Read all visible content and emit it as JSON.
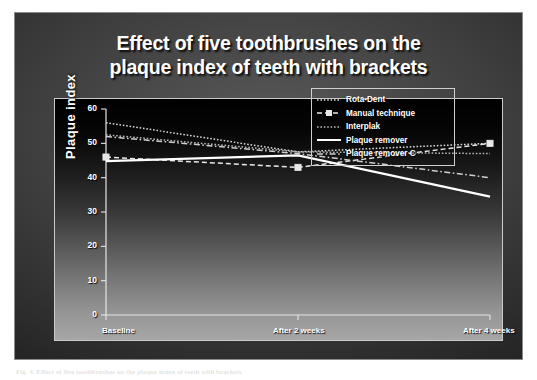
{
  "slide": {
    "title": "Effect of five toothbrushes on the\nplaque index of teeth with brackets",
    "background_color": "#3f3f3f",
    "border_color": "#8b8b8b"
  },
  "caption": {
    "text": "Fig. 4. Effect of five toothbrushes on the plaque index of teeth with brackets"
  },
  "chart_data": {
    "type": "line",
    "title": "Effect of five toothbrushes on the plaque index of teeth with brackets",
    "xlabel": "",
    "ylabel": "Plaque index",
    "categories": [
      "Baseline",
      "After 2 weeks",
      "After 4 weeks"
    ],
    "ylim": [
      0,
      60
    ],
    "yticks": [
      0,
      10,
      20,
      30,
      40,
      50,
      60
    ],
    "grid": false,
    "legend_position": "right",
    "series": [
      {
        "name": "Rota-Dent",
        "values": [
          56,
          47.5,
          50
        ],
        "color": "#d8d8d8",
        "line_style": "dotted",
        "marker": "none"
      },
      {
        "name": "Manual technique",
        "values": [
          46,
          43,
          50
        ],
        "color": "#e8e8e8",
        "line_style": "dashed",
        "marker": "square"
      },
      {
        "name": "Interplak",
        "values": [
          52.5,
          47.5,
          47
        ],
        "color": "#b8b8b8",
        "line_style": "dotted",
        "marker": "none"
      },
      {
        "name": "Plaque remover",
        "values": [
          44.8,
          46.5,
          34.5
        ],
        "color": "#ffffff",
        "line_style": "solid",
        "marker": "none"
      },
      {
        "name": "Plaque remover C",
        "values": [
          52,
          47,
          40
        ],
        "color": "#cfcfcf",
        "line_style": "dash-dot",
        "marker": "none"
      }
    ],
    "ytick_labels": [
      "0",
      "10",
      "20",
      "30",
      "40",
      "50",
      "60"
    ],
    "xtick_labels": [
      "Baseline",
      "After 2 weeks",
      "After 4 weeks"
    ]
  }
}
